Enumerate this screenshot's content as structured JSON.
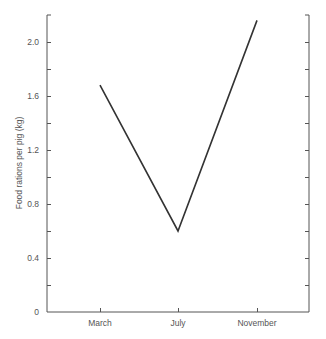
{
  "chart_data": {
    "type": "line",
    "title": "",
    "xlabel": "",
    "ylabel": "Food rations per pig (kg)",
    "categories": [
      "March",
      "July",
      "November"
    ],
    "series": [
      {
        "name": "Food rations per pig",
        "values": [
          1.68,
          0.6,
          2.16
        ]
      }
    ],
    "ylim": [
      0,
      2.2
    ],
    "yticks_labeled": [
      "0",
      "0.4",
      "0.8",
      "1.2",
      "1.6",
      "2.0"
    ],
    "ytick_values": [
      0,
      0.4,
      0.8,
      1.2,
      1.6,
      2.0
    ],
    "minor_tick_step": 0.2,
    "grid": false,
    "legend": null,
    "line_color": "#333333",
    "axis_color": "#555555"
  }
}
